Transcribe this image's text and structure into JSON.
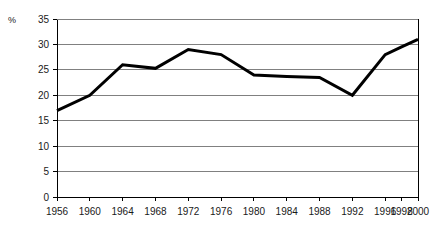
{
  "chart_data": {
    "type": "line",
    "title": "",
    "subtitle": "",
    "xlabel": "",
    "ylabel": "%",
    "unit_label": "%",
    "categories": [
      "1956",
      "1960",
      "1964",
      "1968",
      "1972",
      "1976",
      "1980",
      "1984",
      "1988",
      "1992",
      "1996",
      "1998",
      "2000"
    ],
    "values": [
      17,
      20,
      26,
      25.3,
      29,
      28,
      24,
      23.7,
      23.5,
      20,
      28,
      29.5,
      31
    ],
    "series": [
      {
        "name": "",
        "values": [
          17,
          20,
          26,
          25.3,
          29,
          28,
          24,
          23.7,
          23.5,
          20,
          28,
          29.5,
          31
        ]
      }
    ],
    "ylim": [
      0,
      35
    ],
    "yticks": [
      0,
      5,
      10,
      15,
      20,
      25,
      30,
      35
    ],
    "ytick_labels": [
      "0",
      "5",
      "10",
      "15",
      "20",
      "25",
      "30",
      "35"
    ],
    "xtick_labels": [
      "1956",
      "1960",
      "1964",
      "1968",
      "1972",
      "1976",
      "1980",
      "1984",
      "1988",
      "1992",
      "1996",
      "1998",
      "2000"
    ],
    "grid": true,
    "grid_axis": "y",
    "legend": false,
    "legend_position": "none",
    "line_color": "#000000",
    "line_width": 3,
    "grid_color": "#808080",
    "axis_color": "#000000",
    "background": "#ffffff",
    "annotations": []
  },
  "axis": {
    "y_unit": "%",
    "y_min_label": "0",
    "y_max_label": "35"
  }
}
